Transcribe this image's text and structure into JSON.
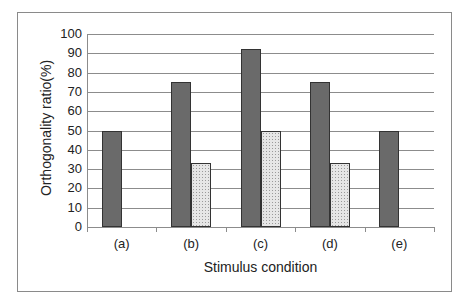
{
  "chart_data": {
    "type": "bar",
    "title": "",
    "xlabel": "Stimulus condition",
    "ylabel": "Orthogonality ratio(%)",
    "categories": [
      "(a)",
      "(b)",
      "(c)",
      "(d)",
      "(e)"
    ],
    "series": [
      {
        "name": "Series 1 (dark gray)",
        "color": "#6a6a6a",
        "values": [
          50,
          75,
          92,
          75,
          50
        ]
      },
      {
        "name": "Series 2 (dotted light)",
        "color": "#e6e6e6",
        "values": [
          0,
          33,
          50,
          33,
          0
        ]
      }
    ],
    "ylim": [
      0,
      100
    ],
    "yticks": [
      0,
      10,
      20,
      30,
      40,
      50,
      60,
      70,
      80,
      90,
      100
    ],
    "grid": true,
    "legend": "none"
  },
  "background_text": "...the presence of the signal ... reading ... as a vector..."
}
